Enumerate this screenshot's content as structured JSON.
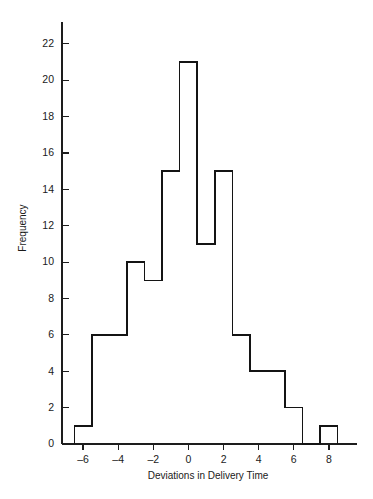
{
  "chart_data": {
    "type": "bar",
    "title": "",
    "subtitle": "",
    "xlabel": "Deviations in Delivery Time",
    "ylabel": "Frequency",
    "grid": false,
    "legend": null,
    "xlim": [
      -7.2,
      9.6
    ],
    "ylim": [
      0,
      23.2
    ],
    "xticks": [
      -6,
      -4,
      -2,
      0,
      2,
      4,
      6,
      8
    ],
    "xtick_labels": [
      "–6",
      "–4",
      "–2",
      "0",
      "2",
      "4",
      "6",
      "8"
    ],
    "yticks": [
      0,
      2,
      4,
      6,
      8,
      10,
      12,
      14,
      16,
      18,
      20,
      22
    ],
    "ytick_labels": [
      "0",
      "2",
      "4",
      "6",
      "8",
      "10",
      "12",
      "14",
      "16",
      "18",
      "20",
      "22"
    ],
    "bin_width": 1,
    "bin_edges": [
      -6.5,
      -5.5,
      -4.5,
      -3.5,
      -2.5,
      -1.5,
      -0.5,
      0.5,
      1.5,
      2.5,
      3.5,
      4.5,
      5.5,
      6.5,
      7.5,
      8.5
    ],
    "bin_centers": [
      -6,
      -5,
      -4,
      -3,
      -2,
      -1,
      0,
      1,
      2,
      3,
      4,
      5,
      6,
      7,
      8
    ],
    "categories": [
      "-6",
      "-5",
      "-4",
      "-3",
      "-2",
      "-1",
      "0",
      "1",
      "2",
      "3",
      "4",
      "5",
      "6",
      "7",
      "8"
    ],
    "values": [
      1,
      6,
      6,
      10,
      9,
      15,
      21,
      11,
      15,
      6,
      4,
      4,
      2,
      0,
      1
    ],
    "total_count": 111,
    "bar_fill": "#ffffff",
    "bar_stroke": "#141414",
    "axis_color": "#1d1d1d",
    "background": "#ffffff"
  },
  "axes": {
    "y_title": "Frequency",
    "x_title": "Deviations in Delivery Time"
  }
}
